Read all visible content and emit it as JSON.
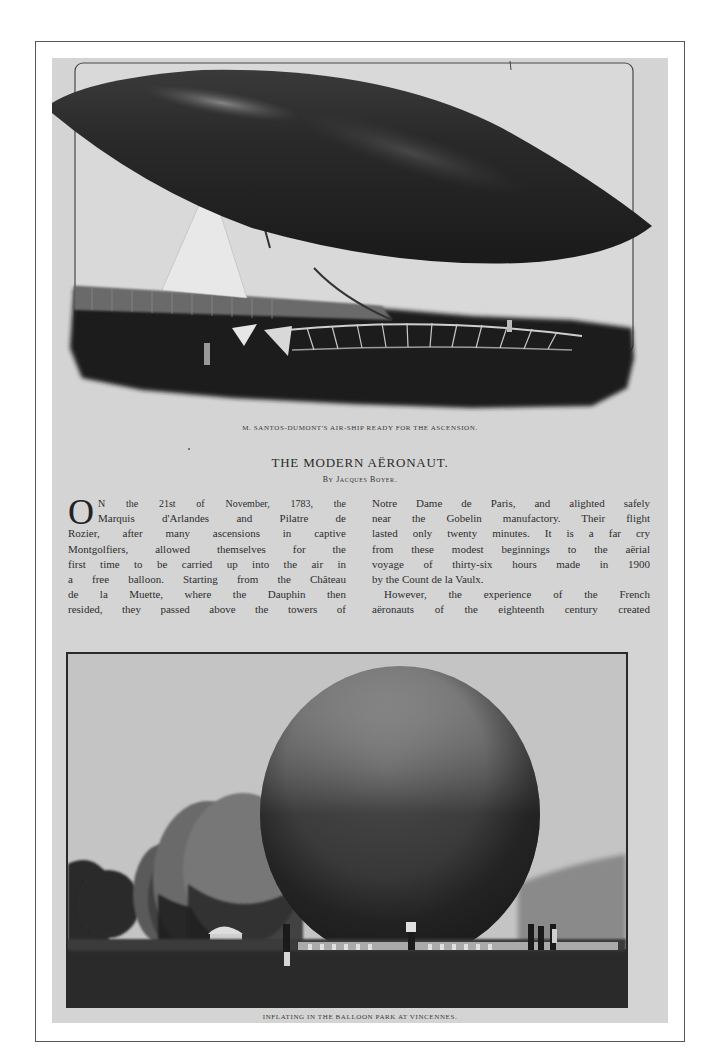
{
  "page": {
    "background": "#d4d4d4",
    "frame_color": "#555555"
  },
  "top_figure": {
    "subject": "airship",
    "caption": "M. Santos-Dumont's air-ship ready for the ascension."
  },
  "article": {
    "title": "THE MODERN AËRONAUT.",
    "byline": "By Jacques Boyer.",
    "drop_cap": "O",
    "left_column": [
      "N the 21st of November, 1783, the",
      "Marquis d'Arlandes and Pilatre de",
      "Rozier, after many ascensions in captive",
      "Montgolfiers, allowed themselves for the",
      "first time to be carried up into the air in",
      "a free balloon.   Starting from the Château",
      "de la Muette, where the Dauphin then",
      "resided, they passed above the towers of"
    ],
    "right_column": [
      "Notre Dame de Paris, and alighted safely",
      "near the Gobelin manufactory.   Their flight",
      "lasted only twenty minutes.   It is a far cry",
      "from these modest beginnings to the aërial",
      "voyage of thirty-six hours made in 1900",
      "by the Count de la Vaulx.",
      "However, the experience of the French",
      "aëronauts of the eighteenth century created"
    ]
  },
  "bottom_figure": {
    "subject": "balloons-inflating",
    "caption": "Inflating in the balloon park at Vincennes."
  }
}
